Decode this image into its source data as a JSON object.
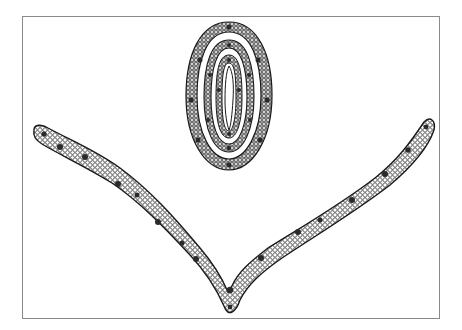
{
  "figure": {
    "type": "botanical-illustration",
    "frame": {
      "x": 22,
      "y": 16,
      "width": 419,
      "height": 304,
      "stroke": "#8a8a8a"
    },
    "colors": {
      "ink": "#1a1a1a",
      "cell": "#ffffff",
      "bundle": "#2a2a2a",
      "background": "#ffffff"
    },
    "rolled_leaf": {
      "cx": 229,
      "cy": 96,
      "rx": 42,
      "ry": 73,
      "rings": [
        {
          "rx": 42,
          "ry": 73,
          "width": 7
        },
        {
          "rx": 32,
          "ry": 60,
          "width": 6
        },
        {
          "rx": 23,
          "ry": 47,
          "width": 6
        },
        {
          "rx": 14,
          "ry": 35,
          "width": 5
        }
      ]
    },
    "open_leaf": {
      "left_arm": [
        [
          38,
          128
        ],
        [
          60,
          142
        ],
        [
          95,
          158
        ],
        [
          130,
          185
        ],
        [
          160,
          215
        ],
        [
          190,
          245
        ],
        [
          215,
          275
        ],
        [
          232,
          300
        ]
      ],
      "right_arm": [
        [
          232,
          300
        ],
        [
          245,
          278
        ],
        [
          275,
          252
        ],
        [
          310,
          228
        ],
        [
          350,
          202
        ],
        [
          390,
          170
        ],
        [
          415,
          140
        ],
        [
          430,
          122
        ]
      ],
      "thickness": 14,
      "midrib": {
        "x": 232,
        "y": 292
      }
    }
  }
}
